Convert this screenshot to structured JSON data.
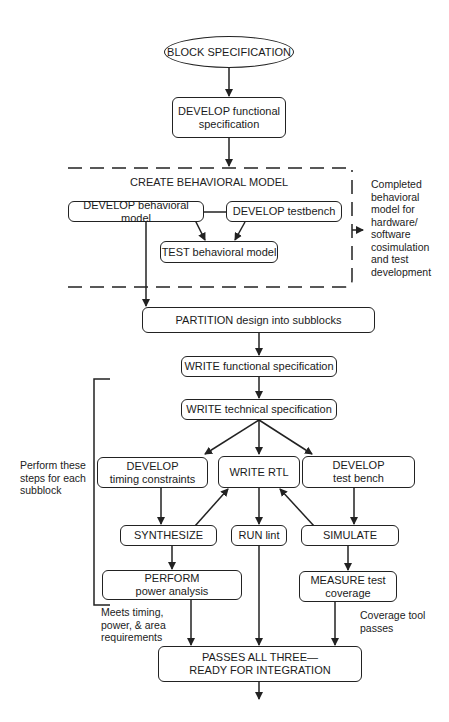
{
  "diagram": {
    "start": "BLOCK SPECIFICATION",
    "develop_functional": [
      "DEVELOP functional",
      "specification"
    ],
    "behavioral_group": {
      "title": "CREATE BEHAVIORAL MODEL",
      "develop_behavioral": "DEVELOP behavioral model",
      "develop_testbench": "DEVELOP testbench",
      "test_behavioral": "TEST behavioral model",
      "output_note": [
        "Completed",
        "behavioral",
        "model for",
        "hardware/",
        "software",
        "cosimulation",
        "and test",
        "development"
      ]
    },
    "partition": "PARTITION design into subblocks",
    "write_functional": "WRITE functional specification",
    "write_technical": "WRITE technical specification",
    "subblock_note": [
      "Perform these",
      "steps for each",
      "subblock"
    ],
    "develop_timing": [
      "DEVELOP",
      "timing constraints"
    ],
    "write_rtl": "WRITE RTL",
    "develop_test_bench": [
      "DEVELOP",
      "test bench"
    ],
    "synthesize": "SYNTHESIZE",
    "run_lint": "RUN lint",
    "simulate": "SIMULATE",
    "perform_power": [
      "PERFORM",
      "power analysis"
    ],
    "measure_coverage": [
      "MEASURE test",
      "coverage"
    ],
    "timing_note": [
      "Meets timing,",
      "power, & area",
      "requirements"
    ],
    "coverage_note": [
      "Coverage tool",
      "passes"
    ],
    "final": [
      "PASSES ALL THREE—",
      "READY FOR INTEGRATION"
    ]
  }
}
